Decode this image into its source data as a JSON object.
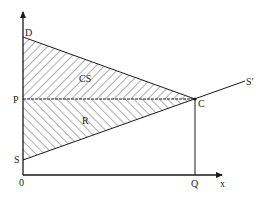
{
  "diagram": {
    "type": "economics-surplus-diagram",
    "axes": {
      "origin_label": "0",
      "x_axis_label": "x"
    },
    "points": {
      "D": "D",
      "P": "P",
      "S": "S",
      "C": "C",
      "Q": "Q",
      "S_prime": "S′"
    },
    "regions": {
      "consumer_surplus": "CS",
      "revenue": "R"
    },
    "colors": {
      "line": "#1a1a1a",
      "hatch": "#333333",
      "background": "#ffffff"
    }
  }
}
